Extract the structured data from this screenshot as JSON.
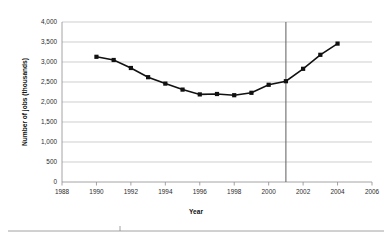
{
  "chart_data": {
    "type": "line",
    "title": "",
    "xlabel": "Year",
    "ylabel": "Number of jobs (thousands)",
    "xlim": [
      1988,
      2006
    ],
    "ylim": [
      0,
      4000
    ],
    "grid": true,
    "legend": false,
    "x": [
      1990,
      1991,
      1992,
      1993,
      1994,
      1995,
      1996,
      1997,
      1998,
      1999,
      2000,
      2001,
      2002,
      2003,
      2004
    ],
    "values": [
      3130,
      3050,
      2850,
      2620,
      2460,
      2310,
      2190,
      2200,
      2170,
      2230,
      2430,
      2520,
      2830,
      3180,
      3460
    ],
    "series": [
      {
        "name": "Number of jobs",
        "values": [
          3130,
          3050,
          2850,
          2620,
          2460,
          2310,
          2190,
          2200,
          2170,
          2230,
          2430,
          2520,
          2830,
          3180,
          3460
        ]
      }
    ],
    "xticks": [
      "1988",
      "1990",
      "1992",
      "1994",
      "1996",
      "1998",
      "2000",
      "2002",
      "2004",
      "2006"
    ],
    "xtick_values": [
      1988,
      1990,
      1992,
      1994,
      1996,
      1998,
      2000,
      2002,
      2004,
      2006
    ],
    "yticks": [
      "0",
      "500",
      "1,000",
      "1,500",
      "2,000",
      "2,500",
      "3,000",
      "3,500",
      "4,000"
    ],
    "ytick_values": [
      0,
      500,
      1000,
      1500,
      2000,
      2500,
      3000,
      3500,
      4000
    ],
    "annotations": [
      {
        "name": "vertical-reference-line",
        "x": 2001,
        "label": ""
      }
    ],
    "colors": {
      "line": "#111111",
      "marker": "#111111",
      "grid": "#b9b9b9",
      "axis": "#8d8d8d",
      "reference_line": "#6b6b6b",
      "background": "#ffffff"
    },
    "marker_style": "square"
  }
}
